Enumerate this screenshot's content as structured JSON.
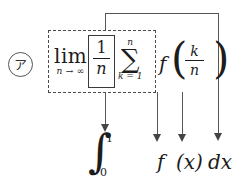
{
  "figure": {
    "type": "math-annotation-diagram",
    "item_label": "ア",
    "background_color": "#ffffff",
    "ink_color": "#1c1c1c",
    "line_color": "#555555"
  },
  "top_expression": {
    "limit": {
      "operator": "lim",
      "subscript": "n → ∞"
    },
    "boxed_fraction": {
      "numerator": "1",
      "denominator": "n"
    },
    "summation": {
      "glyph": "∑",
      "upper": "n",
      "lower": "k = 1"
    },
    "function": {
      "name": "f",
      "paren_left": "(",
      "paren_right": ")"
    },
    "argument_fraction": {
      "numerator": "k",
      "denominator": "n"
    }
  },
  "bottom_expression": {
    "integral": {
      "glyph": "∫",
      "upper_limit": "1",
      "lower_limit": "0"
    },
    "function": "f",
    "variable": "(x)",
    "differential": "dx"
  },
  "annotations": {
    "dashed_group_meaning": "limit of (1/n)·sum  maps to  definite integral from 0 to 1",
    "solid_box_meaning": "1/n maps to dx",
    "arrow_labels": [
      "lim (1/n) Σ  →  ∫₀¹",
      "f  →  f",
      "(k/n)  →  (x)",
      "1/n  →  dx"
    ]
  }
}
